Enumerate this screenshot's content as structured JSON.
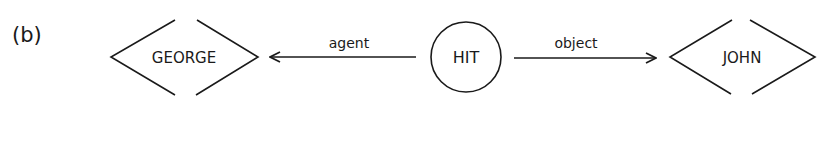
{
  "figure": {
    "panel_label": "(b)",
    "nodes": [
      {
        "id": "george",
        "label": "GEORGE",
        "shape": "diamond-open"
      },
      {
        "id": "hit",
        "label": "HIT",
        "shape": "circle"
      },
      {
        "id": "john",
        "label": "JOHN",
        "shape": "diamond-open"
      }
    ],
    "edges": [
      {
        "from": "hit",
        "to": "george",
        "label": "agent"
      },
      {
        "from": "hit",
        "to": "john",
        "label": "object"
      }
    ],
    "colors": {
      "ink": "#1a1a1a",
      "background": "#ffffff"
    }
  }
}
